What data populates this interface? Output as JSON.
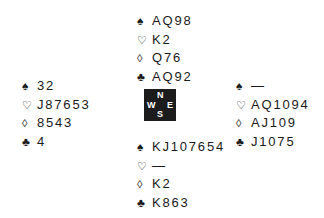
{
  "icons": {
    "spade": "♠",
    "heart": "♡",
    "diamond": "◊",
    "club": "♣"
  },
  "compass": {
    "north": "N",
    "south": "S",
    "west": "W",
    "east": "E"
  },
  "hands": {
    "north": {
      "spades": "AQ98",
      "hearts": "K2",
      "diamonds": "Q76",
      "clubs": "AQ92"
    },
    "west": {
      "spades": "32",
      "hearts": "J87653",
      "diamonds": "8543",
      "clubs": "4"
    },
    "east": {
      "spades": "—",
      "hearts": "AQ1094",
      "diamonds": "AJ109",
      "clubs": "J1075"
    },
    "south": {
      "spades": "KJ107654",
      "hearts": "—",
      "diamonds": "K2",
      "clubs": "K863"
    }
  }
}
